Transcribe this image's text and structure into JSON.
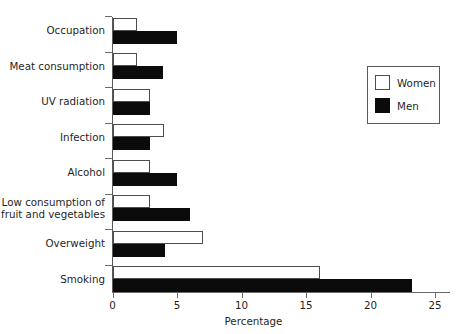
{
  "chart_data": {
    "type": "bar",
    "orientation": "horizontal",
    "title": "",
    "xlabel": "Percentage",
    "ylabel": "",
    "xlim": [
      0,
      25
    ],
    "xticks": [
      0,
      5,
      10,
      15,
      20,
      25
    ],
    "xtick_labels": [
      "0",
      "5",
      "10",
      "15",
      "20",
      "25"
    ],
    "grid": false,
    "legend_position": "top-right",
    "categories": [
      "Occupation",
      "Meat consumption",
      "UV radiation",
      "Infection",
      "Alcohol",
      "Low consumption of\nfruit and vegetables",
      "Overweight",
      "Smoking"
    ],
    "series": [
      {
        "name": "Women",
        "color": "#ffffff",
        "edge_color": "#4d4d4d",
        "values": [
          1.9,
          1.9,
          2.9,
          4.0,
          2.9,
          2.9,
          7.0,
          16.1
        ]
      },
      {
        "name": "Men",
        "color": "#0b0b0b",
        "edge_color": "#0b0b0b",
        "values": [
          5.0,
          3.9,
          2.9,
          2.9,
          5.0,
          6.0,
          4.1,
          23.2
        ]
      }
    ]
  },
  "legend": {
    "entries": [
      {
        "label": "Women"
      },
      {
        "label": "Men"
      }
    ]
  }
}
